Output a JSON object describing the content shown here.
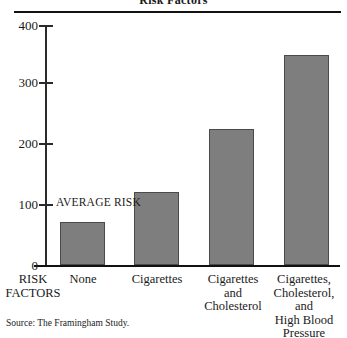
{
  "chart_data": {
    "type": "bar",
    "title": "Risk Factors",
    "categories": [
      "None",
      "Cigarettes",
      "Cigarettes\nand\nCholesterol",
      "Cigarettes,\nCholesterol,\nand\nHigh Blood\nPressure"
    ],
    "category_lines": [
      [
        "None"
      ],
      [
        "Cigarettes"
      ],
      [
        "Cigarettes",
        "and",
        "Cholesterol"
      ],
      [
        "Cigarettes,",
        "Cholesterol,",
        "and",
        "High Blood",
        "Pressure"
      ]
    ],
    "values": [
      72,
      121,
      226,
      348
    ],
    "xlabel": "RISK FACTORS",
    "ylabel": "",
    "ylim": [
      0,
      400
    ],
    "yticks": [
      0,
      100,
      200,
      300,
      400
    ],
    "ytick_labels": [
      "0",
      "100",
      "200",
      "300",
      "400"
    ],
    "grid": false,
    "legend": null,
    "annotations": [
      {
        "text": "AVERAGE RISK",
        "x_value": 0,
        "y_value": 100
      }
    ],
    "source": "Source: The Framingham Study.",
    "bar_color": "#7e7e7e",
    "bar_edge_color": "#4a4a4a",
    "axis_color": "#111111",
    "background_color": "#ffffff"
  },
  "axis_caption": {
    "line1": "RISK",
    "line2": "FACTORS"
  }
}
